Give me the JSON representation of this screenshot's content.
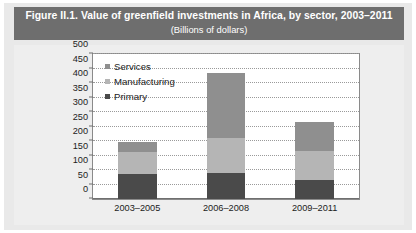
{
  "figure": {
    "title_main": "Figure II.1.  Value of greenfield investments in Africa, by sector, 2003–2011",
    "title_sub": "(Billions of dollars)"
  },
  "colors": {
    "title_bar_bg": "#6e6e6e",
    "title_bar_text": "#ffffff",
    "page_bg": "#e9e9e9",
    "chart_bg": "#eeeeee",
    "plot_bg": "#ffffff",
    "axis": "#6f6f6f",
    "gridline": "#9a9a9a",
    "primary": "#4a4a4a",
    "manufacturing": "#b5b5b5",
    "services": "#8f8f8f"
  },
  "chart_data": {
    "type": "bar",
    "subtype": "stacked",
    "title": "Value of greenfield investments in Africa, by sector, 2003–2011",
    "subtitle": "(Billions of dollars)",
    "xlabel": "",
    "ylabel": "",
    "ylim": [
      0,
      500
    ],
    "ytick_step": 50,
    "yticks": [
      500,
      450,
      400,
      350,
      300,
      250,
      200,
      150,
      100,
      50,
      0
    ],
    "ytick_labels": [
      "500",
      "450",
      "400",
      "350",
      "300",
      "250",
      "200",
      "150",
      "100",
      "50",
      "0"
    ],
    "grid": true,
    "grid_axis": "y",
    "legend_position": "upper-left-inside",
    "categories": [
      "2003–2005",
      "2006–2008",
      "2009–2011"
    ],
    "series": [
      {
        "name": "Primary",
        "color": "#4a4a4a",
        "values": [
          85,
          91,
          65
        ]
      },
      {
        "name": "Manufacturing",
        "color": "#b5b5b5",
        "values": [
          78,
          118,
          99
        ]
      },
      {
        "name": "Services",
        "color": "#8f8f8f",
        "values": [
          34,
          224,
          103
        ]
      }
    ],
    "stack_order_bottom_to_top": [
      "Primary",
      "Manufacturing",
      "Services"
    ],
    "totals": [
      197,
      433,
      267
    ]
  }
}
